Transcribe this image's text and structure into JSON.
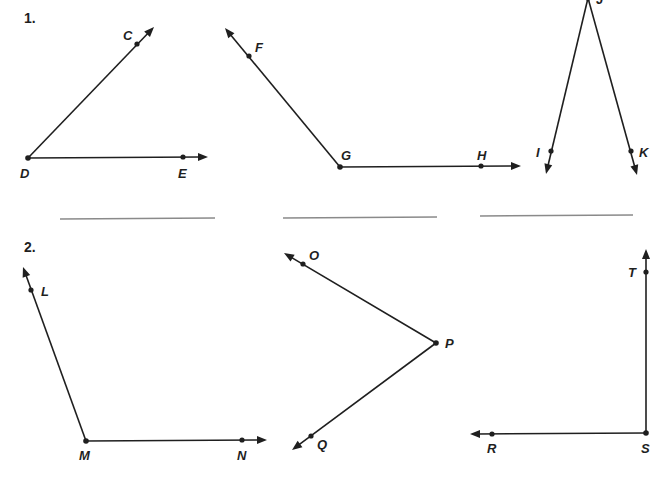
{
  "problems": [
    {
      "number": "1.",
      "number_pos": [
        24,
        23
      ],
      "angles": [
        {
          "name": "angle-CDE",
          "vertex": {
            "label": "D",
            "x": 28,
            "y": 158,
            "lx": 20,
            "ly": 178
          },
          "rays": [
            {
              "point": {
                "label": "C",
                "x": 137,
                "y": 44,
                "lx": 123,
                "ly": 40
              },
              "tip": [
                154,
                27
              ]
            },
            {
              "point": {
                "label": "E",
                "x": 183,
                "y": 157,
                "lx": 178,
                "ly": 178
              },
              "tip": [
                208,
                157
              ]
            }
          ]
        },
        {
          "name": "angle-FGH",
          "vertex": {
            "label": "G",
            "x": 340,
            "y": 167,
            "lx": 341,
            "ly": 160
          },
          "rays": [
            {
              "point": {
                "label": "F",
                "x": 249,
                "y": 56,
                "lx": 255,
                "ly": 52
              },
              "tip": [
                225,
                28
              ]
            },
            {
              "point": {
                "label": "H",
                "x": 481,
                "y": 166,
                "lx": 477,
                "ly": 160
              },
              "tip": [
                521,
                166
              ]
            }
          ]
        },
        {
          "name": "angle-IJK",
          "vertex": {
            "label": "J",
            "x": 588,
            "y": -2,
            "lx": 596,
            "ly": 4
          },
          "rays": [
            {
              "point": {
                "label": "I",
                "x": 551,
                "y": 151,
                "lx": 536,
                "ly": 157
              },
              "tip": [
                546,
                174
              ]
            },
            {
              "point": {
                "label": "K",
                "x": 631,
                "y": 151,
                "lx": 639,
                "ly": 157
              },
              "tip": [
                637,
                175
              ]
            }
          ]
        }
      ],
      "answer_lines": [
        {
          "x1": 60,
          "y1": 219,
          "x2": 215,
          "y2": 218
        },
        {
          "x1": 283,
          "y1": 218,
          "x2": 437,
          "y2": 217
        },
        {
          "x1": 480,
          "y1": 216,
          "x2": 633,
          "y2": 215
        }
      ]
    },
    {
      "number": "2.",
      "number_pos": [
        24,
        252
      ],
      "angles": [
        {
          "name": "angle-LMN",
          "vertex": {
            "label": "M",
            "x": 86,
            "y": 441,
            "lx": 79,
            "ly": 460
          },
          "rays": [
            {
              "point": {
                "label": "L",
                "x": 31,
                "y": 290,
                "lx": 41,
                "ly": 296
              },
              "tip": [
                23,
                267
              ]
            },
            {
              "point": {
                "label": "N",
                "x": 242,
                "y": 440,
                "lx": 237,
                "ly": 460
              },
              "tip": [
                267,
                440
              ]
            }
          ]
        },
        {
          "name": "angle-OPQ",
          "vertex": {
            "label": "P",
            "x": 436,
            "y": 343,
            "lx": 445,
            "ly": 348
          },
          "rays": [
            {
              "point": {
                "label": "O",
                "x": 303,
                "y": 264,
                "lx": 309,
                "ly": 260
              },
              "tip": [
                284,
                253
              ]
            },
            {
              "point": {
                "label": "Q",
                "x": 311,
                "y": 436,
                "lx": 317,
                "ly": 449
              },
              "tip": [
                292,
                450
              ]
            }
          ]
        },
        {
          "name": "angle-RST",
          "vertex": {
            "label": "S",
            "x": 646,
            "y": 433,
            "lx": 641,
            "ly": 453
          },
          "rays": [
            {
              "point": {
                "label": "T",
                "x": 646,
                "y": 272,
                "lx": 628,
                "ly": 277
              },
              "tip": [
                646,
                249
              ]
            },
            {
              "point": {
                "label": "R",
                "x": 492,
                "y": 434,
                "lx": 487,
                "ly": 453
              },
              "tip": [
                470,
                434
              ]
            }
          ]
        }
      ],
      "answer_lines": []
    }
  ]
}
